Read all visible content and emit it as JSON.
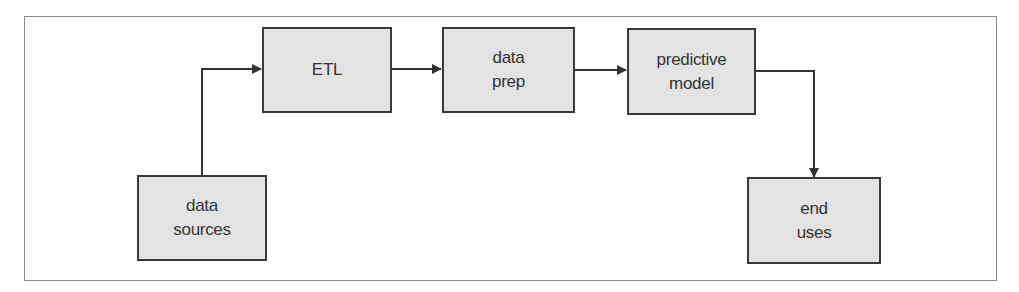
{
  "diagram": {
    "type": "flowchart",
    "colors": {
      "frame_border": "#8a8a8a",
      "node_fill": "#e3e3e3",
      "node_border": "#3a3a3a",
      "edge": "#333333",
      "text": "#333333"
    },
    "nodes": [
      {
        "id": "data_sources",
        "label": "data\nsources"
      },
      {
        "id": "etl",
        "label": "ETL"
      },
      {
        "id": "data_prep",
        "label": "data\nprep"
      },
      {
        "id": "predictive_model",
        "label": "predictive\nmodel"
      },
      {
        "id": "end_uses",
        "label": "end\nuses"
      }
    ],
    "edges": [
      {
        "from": "data_sources",
        "to": "etl"
      },
      {
        "from": "etl",
        "to": "data_prep"
      },
      {
        "from": "data_prep",
        "to": "predictive_model"
      },
      {
        "from": "predictive_model",
        "to": "end_uses"
      }
    ]
  }
}
